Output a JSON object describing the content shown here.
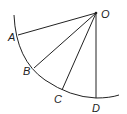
{
  "diagram": {
    "type": "geometry",
    "stroke_color": "#222222",
    "background": "#ffffff",
    "points": {
      "O": {
        "label": "O",
        "x": 96,
        "y": 13
      },
      "A": {
        "label": "A",
        "x": 18,
        "y": 35
      },
      "B": {
        "label": "B",
        "x": 34,
        "y": 68
      },
      "C": {
        "label": "C",
        "x": 62,
        "y": 90
      },
      "D": {
        "label": "D",
        "x": 96,
        "y": 98
      }
    },
    "segments": [
      "OA",
      "OB",
      "OC",
      "OD"
    ],
    "arc": {
      "through": [
        "A",
        "B",
        "C",
        "D"
      ],
      "center": "O"
    }
  }
}
